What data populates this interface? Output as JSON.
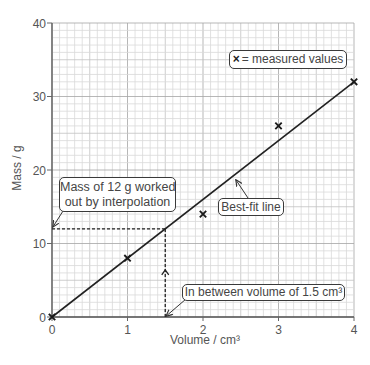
{
  "chart_data": {
    "type": "scatter",
    "title": "",
    "xlabel": "Volume / cm³",
    "ylabel": "Mass / g",
    "xlim": [
      0,
      4
    ],
    "ylim": [
      0,
      40
    ],
    "xticks": [
      0,
      1,
      2,
      3,
      4
    ],
    "yticks": [
      0,
      10,
      20,
      30,
      40
    ],
    "grid": true,
    "grid_minor_step": {
      "x": 0.1,
      "y": 1
    },
    "series": [
      {
        "name": "measured values",
        "marker": "x",
        "x": [
          0,
          1,
          2,
          3,
          4
        ],
        "y": [
          0,
          8,
          14,
          26,
          32
        ]
      }
    ],
    "best_fit_line": {
      "label": "Best-fit line",
      "x": [
        0,
        4
      ],
      "y": [
        0,
        32
      ]
    },
    "interpolation": {
      "x": 1.5,
      "y": 12
    },
    "legend": {
      "symbol": "×",
      "text": "= measured values",
      "position": "top-right"
    },
    "annotations": {
      "interpolation_label": {
        "line1": "Mass of 12 g worked",
        "line2": "out by interpolation"
      },
      "best_fit_label": "Best-fit line",
      "volume_label": "In between volume of 1.5 cm³"
    }
  }
}
